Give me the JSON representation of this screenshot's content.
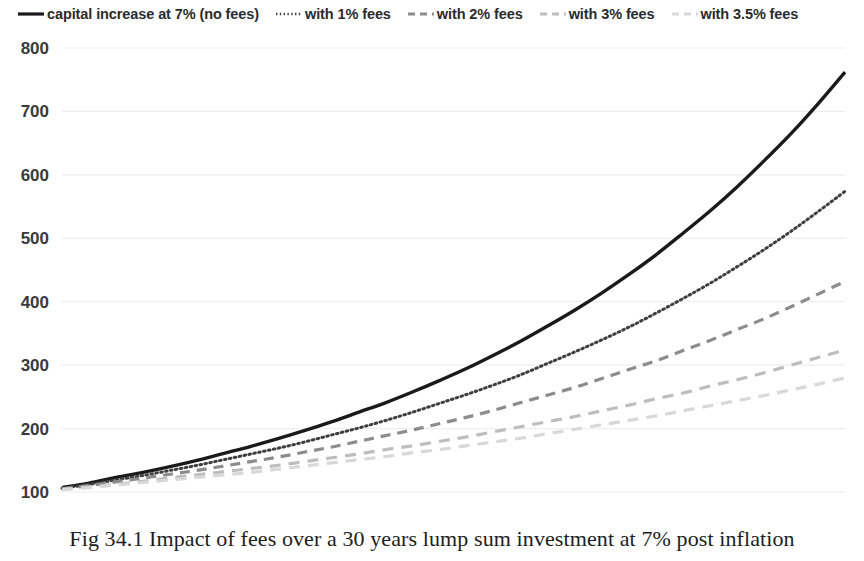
{
  "legend": {
    "position": "top",
    "items": [
      {
        "label": "capital increase at 7% (no fees)",
        "style": "solid",
        "color": "#1a1a1a"
      },
      {
        "label": "with 1% fees",
        "style": "dotted",
        "color": "#3f3f3f"
      },
      {
        "label": "with 2% fees",
        "style": "dashed",
        "color": "#8c8c8c"
      },
      {
        "label": "with 3% fees",
        "style": "dashed",
        "color": "#bdbdbd"
      },
      {
        "label": "with 3.5% fees",
        "style": "dashed",
        "color": "#d8d8d8"
      }
    ]
  },
  "caption": {
    "text": "Fig 34.1 Impact of fees over a 30 years lump sum investment at 7% post inflation"
  },
  "axes": {
    "y_ticks": [
      "100",
      "200",
      "300",
      "400",
      "500",
      "600",
      "700",
      "800"
    ],
    "x_ticks": [
      "1",
      "3",
      "5",
      "7",
      "9",
      "11",
      "13",
      "15",
      "17",
      "19",
      "21",
      "23",
      "25",
      "27",
      "29"
    ],
    "grid": "horizontal"
  },
  "chart_data": {
    "type": "line",
    "title": "Fig 34.1 Impact of fees over a 30 years lump sum investment at 7% post inflation",
    "xlabel": "",
    "ylabel": "",
    "xlim": [
      1,
      30
    ],
    "ylim": [
      100,
      800
    ],
    "ytick_step": 100,
    "grid": true,
    "legend_position": "top",
    "x": [
      1,
      2,
      3,
      4,
      5,
      6,
      7,
      8,
      9,
      10,
      11,
      12,
      13,
      14,
      15,
      16,
      17,
      18,
      19,
      20,
      21,
      22,
      23,
      24,
      25,
      26,
      27,
      28,
      29,
      30
    ],
    "series": [
      {
        "name": "capital increase at 7% (no fees)",
        "style": "solid",
        "color": "#1a1a1a",
        "net_rate_pct": 7.0,
        "values": [
          107,
          114,
          123,
          131,
          140,
          150,
          161,
          172,
          184,
          197,
          211,
          226,
          241,
          258,
          276,
          295,
          316,
          338,
          362,
          387,
          414,
          443,
          474,
          508,
          543,
          581,
          622,
          665,
          712,
          762
        ]
      },
      {
        "name": "with 1% fees",
        "style": "dotted",
        "color": "#3f3f3f",
        "net_rate_pct": 6.0,
        "values": [
          106,
          112,
          119,
          126,
          134,
          142,
          151,
          160,
          169,
          179,
          190,
          201,
          213,
          226,
          240,
          254,
          269,
          285,
          303,
          321,
          340,
          360,
          382,
          405,
          429,
          455,
          482,
          511,
          542,
          574
        ]
      },
      {
        "name": "with 2% fees",
        "style": "dashed",
        "color": "#8c8c8c",
        "net_rate_pct": 5.0,
        "values": [
          105,
          110,
          116,
          122,
          128,
          134,
          141,
          148,
          155,
          163,
          171,
          180,
          189,
          198,
          208,
          218,
          229,
          241,
          253,
          265,
          279,
          293,
          307,
          323,
          339,
          356,
          373,
          392,
          412,
          432
        ]
      },
      {
        "name": "with 3% fees",
        "style": "dashed",
        "color": "#bdbdbd",
        "net_rate_pct": 4.0,
        "values": [
          104,
          108,
          112,
          117,
          122,
          127,
          132,
          137,
          142,
          148,
          154,
          160,
          167,
          173,
          180,
          187,
          195,
          203,
          211,
          219,
          228,
          237,
          247,
          256,
          267,
          277,
          288,
          300,
          312,
          324
        ]
      },
      {
        "name": "with 3.5% fees",
        "style": "dashed",
        "color": "#d8d8d8",
        "net_rate_pct": 3.5,
        "values": [
          104,
          107,
          111,
          115,
          119,
          123,
          127,
          131,
          136,
          141,
          146,
          151,
          156,
          162,
          167,
          173,
          179,
          185,
          192,
          199,
          206,
          213,
          220,
          228,
          236,
          244,
          252,
          261,
          270,
          280
        ]
      }
    ]
  }
}
